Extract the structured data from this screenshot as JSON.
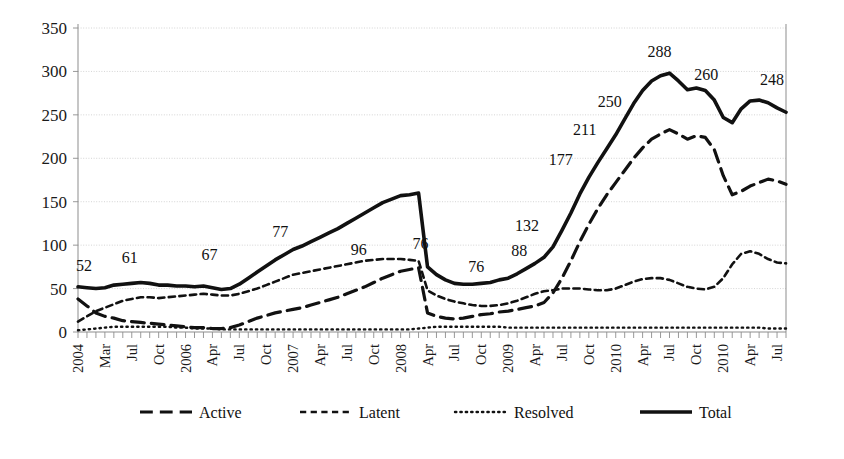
{
  "chart_data": {
    "type": "line",
    "title": "",
    "subtitle": "",
    "xlabel": "",
    "ylabel": "",
    "ylim": [
      0,
      350
    ],
    "yticks": [
      0,
      50,
      100,
      150,
      200,
      250,
      300,
      350
    ],
    "grid": true,
    "legend_position": "bottom",
    "x_tick_interval_months": 3,
    "x": [
      "2004-01",
      "2004-02",
      "2004-03",
      "2004-04",
      "2004-05",
      "2004-06",
      "2004-07",
      "2004-08",
      "2004-09",
      "2004-10",
      "2004-11",
      "2004-12",
      "2005-01",
      "2005-02",
      "2005-03",
      "2005-04",
      "2005-05",
      "2005-06",
      "2005-07",
      "2005-08",
      "2005-09",
      "2005-10",
      "2005-11",
      "2005-12",
      "2006-01",
      "2006-02",
      "2006-03",
      "2006-04",
      "2006-05",
      "2006-06",
      "2006-07",
      "2006-08",
      "2006-09",
      "2006-10",
      "2006-11",
      "2006-12",
      "2007-01",
      "2007-02",
      "2007-03",
      "2007-04",
      "2007-05",
      "2007-06",
      "2007-07",
      "2007-08",
      "2007-09",
      "2007-10",
      "2007-11",
      "2007-12",
      "2008-01",
      "2008-02",
      "2008-03",
      "2008-04",
      "2008-05",
      "2008-06",
      "2008-07",
      "2008-08",
      "2008-09",
      "2008-10",
      "2008-11",
      "2008-12",
      "2009-01",
      "2009-02",
      "2009-03",
      "2009-04",
      "2009-05",
      "2009-06",
      "2009-07",
      "2009-08",
      "2009-09",
      "2009-10",
      "2009-11",
      "2009-12",
      "2010-01",
      "2010-02",
      "2010-03",
      "2010-04",
      "2010-05",
      "2010-06",
      "2010-07",
      "2010-08"
    ],
    "xtick_labels": [
      {
        "index": 0,
        "label": "2004"
      },
      {
        "index": 3,
        "label": "Mar"
      },
      {
        "index": 6,
        "label": "Jul"
      },
      {
        "index": 9,
        "label": "Oct"
      },
      {
        "index": 12,
        "label": "2006"
      },
      {
        "index": 15,
        "label": "Apr"
      },
      {
        "index": 18,
        "label": "Jul"
      },
      {
        "index": 21,
        "label": "Oct"
      },
      {
        "index": 24,
        "label": "2007"
      },
      {
        "index": 27,
        "label": "Apr"
      },
      {
        "index": 30,
        "label": "Jul"
      },
      {
        "index": 33,
        "label": "Oct"
      },
      {
        "index": 36,
        "label": "2008"
      },
      {
        "index": 39,
        "label": "Apr"
      },
      {
        "index": 42,
        "label": "Jul"
      },
      {
        "index": 45,
        "label": "Oct"
      },
      {
        "index": 48,
        "label": "2009"
      },
      {
        "index": 51,
        "label": "Apr"
      },
      {
        "index": 54,
        "label": "Jul"
      },
      {
        "index": 57,
        "label": "Oct"
      },
      {
        "index": 60,
        "label": "2010"
      },
      {
        "index": 63,
        "label": "Apr"
      },
      {
        "index": 66,
        "label": "Jul"
      },
      {
        "index": 69,
        "label": "Oct"
      },
      {
        "index": 72,
        "label": "2010"
      },
      {
        "index": 75,
        "label": "Apr"
      },
      {
        "index": 78,
        "label": "Jul"
      }
    ],
    "series": [
      {
        "name": "Active",
        "dash": "long-dash",
        "color": "#111111",
        "width": 3.2,
        "values": [
          38,
          30,
          22,
          18,
          16,
          13,
          12,
          11,
          10,
          9,
          8,
          7,
          6,
          5,
          5,
          4,
          4,
          5,
          8,
          12,
          16,
          19,
          22,
          24,
          26,
          28,
          31,
          34,
          37,
          40,
          44,
          48,
          52,
          57,
          62,
          66,
          70,
          72,
          74,
          22,
          18,
          16,
          15,
          16,
          18,
          20,
          21,
          23,
          24,
          26,
          28,
          30,
          34,
          45,
          62,
          82,
          104,
          124,
          142,
          158,
          172,
          186,
          200,
          212,
          222,
          228,
          233,
          228,
          222,
          226,
          224,
          210,
          180,
          158,
          162,
          168,
          172,
          176,
          174,
          170
        ]
      },
      {
        "name": "Latent",
        "dash": "short-dash",
        "color": "#111111",
        "width": 2.6,
        "values": [
          12,
          18,
          24,
          28,
          32,
          36,
          38,
          40,
          40,
          39,
          40,
          41,
          42,
          43,
          44,
          43,
          42,
          42,
          44,
          47,
          50,
          54,
          58,
          62,
          66,
          68,
          70,
          72,
          74,
          76,
          78,
          80,
          82,
          83,
          84,
          84,
          84,
          83,
          82,
          48,
          42,
          38,
          35,
          33,
          31,
          30,
          30,
          31,
          33,
          36,
          40,
          44,
          47,
          48,
          50,
          50,
          50,
          49,
          48,
          48,
          50,
          54,
          58,
          61,
          62,
          62,
          60,
          56,
          52,
          50,
          49,
          52,
          62,
          78,
          90,
          93,
          90,
          84,
          80,
          79
        ]
      },
      {
        "name": "Resolved",
        "dash": "dotted",
        "color": "#111111",
        "width": 2.4,
        "values": [
          2,
          3,
          4,
          5,
          6,
          6,
          6,
          6,
          6,
          6,
          6,
          5,
          5,
          4,
          4,
          4,
          3,
          3,
          3,
          3,
          3,
          3,
          3,
          3,
          3,
          3,
          3,
          3,
          3,
          3,
          3,
          3,
          3,
          3,
          3,
          3,
          3,
          3,
          4,
          5,
          6,
          6,
          6,
          6,
          6,
          6,
          6,
          6,
          5,
          5,
          5,
          5,
          5,
          5,
          5,
          5,
          5,
          5,
          5,
          5,
          5,
          5,
          5,
          5,
          5,
          5,
          5,
          5,
          5,
          5,
          5,
          5,
          5,
          5,
          5,
          5,
          5,
          4,
          4,
          4
        ]
      },
      {
        "name": "Total",
        "dash": "solid",
        "color": "#111111",
        "width": 3.6,
        "values": [
          52,
          51,
          50,
          51,
          54,
          55,
          56,
          57,
          56,
          54,
          54,
          53,
          53,
          52,
          53,
          51,
          49,
          50,
          55,
          62,
          69,
          76,
          83,
          89,
          95,
          99,
          104,
          109,
          114,
          119,
          125,
          131,
          137,
          143,
          149,
          153,
          157,
          158,
          160,
          75,
          66,
          60,
          56,
          55,
          55,
          56,
          57,
          60,
          62,
          67,
          73,
          79,
          86,
          98,
          117,
          137,
          159,
          178,
          195,
          211,
          227,
          245,
          263,
          278,
          289,
          295,
          298,
          289,
          279,
          281,
          278,
          267,
          247,
          241,
          257,
          266,
          267,
          264,
          258,
          253
        ]
      }
    ],
    "point_labels": [
      {
        "index": 0,
        "value": 52,
        "text": "52",
        "dx": 6,
        "dy": -16
      },
      {
        "index": 6,
        "value": 56,
        "text": "61",
        "dx": -2,
        "dy": -20
      },
      {
        "index": 14,
        "value": 53,
        "text": "67",
        "dx": 6,
        "dy": -26
      },
      {
        "index": 23,
        "value": 89,
        "text": "77",
        "dx": -4,
        "dy": -18
      },
      {
        "index": 30,
        "value": 125,
        "text": "96",
        "dx": 12,
        "dy": 32
      },
      {
        "index": 38,
        "value": 160,
        "text": "76",
        "dx": 2,
        "dy": 56
      },
      {
        "index": 44,
        "value": 55,
        "text": "76",
        "dx": 4,
        "dy": -12
      },
      {
        "index": 49,
        "value": 67,
        "text": "88",
        "dx": 2,
        "dy": -18
      },
      {
        "index": 53,
        "value": 98,
        "text": "132",
        "dx": -26,
        "dy": -16
      },
      {
        "index": 57,
        "value": 178,
        "text": "177",
        "dx": -28,
        "dy": -12
      },
      {
        "index": 59,
        "value": 211,
        "text": "211",
        "dx": -22,
        "dy": -14
      },
      {
        "index": 62,
        "value": 245,
        "text": "250",
        "dx": -24,
        "dy": -12
      },
      {
        "index": 66,
        "value": 298,
        "text": "288",
        "dx": -10,
        "dy": -16
      },
      {
        "index": 71,
        "value": 267,
        "text": "260",
        "dx": -8,
        "dy": -20
      },
      {
        "index": 77,
        "value": 264,
        "text": "248",
        "dx": 4,
        "dy": -18
      }
    ]
  },
  "legend": {
    "items": [
      {
        "label": "Active",
        "dash": "long-dash"
      },
      {
        "label": "Latent",
        "dash": "short-dash"
      },
      {
        "label": "Resolved",
        "dash": "dotted"
      },
      {
        "label": "Total",
        "dash": "solid"
      }
    ]
  },
  "colors": {
    "ink": "#111111",
    "grid": "#c9c9c9",
    "axis": "#8d8d8d",
    "background": "#ffffff"
  }
}
